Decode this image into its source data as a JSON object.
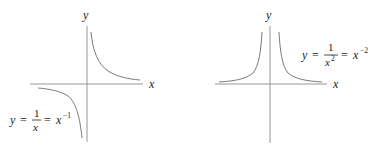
{
  "colors": {
    "axis": "#8a8a8a",
    "curve": "#7a7a7a",
    "text": "#222222",
    "background": "#ffffff"
  },
  "graphs": [
    {
      "id": "reciprocal",
      "x_axis_label": "x",
      "y_axis_label": "y",
      "equation": {
        "lhs": "y",
        "eq1": "=",
        "numerator": "1",
        "denominator": "x",
        "eq2": "=",
        "base": "x",
        "exponent": "−1"
      }
    },
    {
      "id": "inverse-square",
      "x_axis_label": "x",
      "y_axis_label": "y",
      "equation": {
        "lhs": "y",
        "eq1": "=",
        "numerator": "1",
        "denominator": "x",
        "denominator_exponent": "2",
        "eq2": "=",
        "base": "x",
        "exponent": "−2"
      }
    }
  ]
}
